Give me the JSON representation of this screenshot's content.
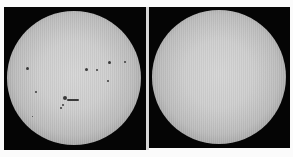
{
  "figure": {
    "panels": [
      {
        "id": "left",
        "label": "",
        "state": "sunspots visible",
        "disk_color": "#d2d2d2",
        "background_color": "#050505",
        "sunspots": [
          {
            "x": 22,
            "y": 60,
            "w": 3,
            "h": 3
          },
          {
            "x": 31,
            "y": 84,
            "w": 2,
            "h": 2
          },
          {
            "x": 81,
            "y": 61,
            "w": 3,
            "h": 3
          },
          {
            "x": 92,
            "y": 62,
            "w": 2,
            "h": 2
          },
          {
            "x": 104,
            "y": 54,
            "w": 3,
            "h": 3
          },
          {
            "x": 120,
            "y": 54,
            "w": 2,
            "h": 2
          },
          {
            "x": 103,
            "y": 73,
            "w": 2,
            "h": 2
          },
          {
            "x": 59,
            "y": 89,
            "w": 4,
            "h": 4
          },
          {
            "x": 63,
            "y": 92,
            "w": 12,
            "h": 2
          },
          {
            "x": 58,
            "y": 97,
            "w": 2,
            "h": 2
          },
          {
            "x": 56,
            "y": 100,
            "w": 2,
            "h": 2
          },
          {
            "x": 28,
            "y": 109,
            "w": 1,
            "h": 1
          }
        ]
      },
      {
        "id": "right",
        "label": "",
        "state": "spotless",
        "disk_color": "#d2d2d2",
        "background_color": "#050505",
        "sunspots": []
      }
    ]
  }
}
